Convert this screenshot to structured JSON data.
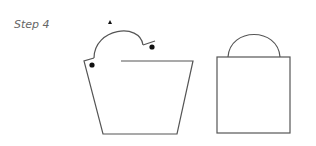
{
  "step_label": "Step 4",
  "colors": {
    "stroke": "#555555",
    "dot": "#111111",
    "text": "#666666"
  },
  "figures": [
    {
      "name": "open-bag-shape",
      "description": "trapezoid bag with folded flap, arc handle and two dots"
    },
    {
      "name": "closed-bag-shape",
      "description": "rectangle with semicircular handle"
    }
  ]
}
